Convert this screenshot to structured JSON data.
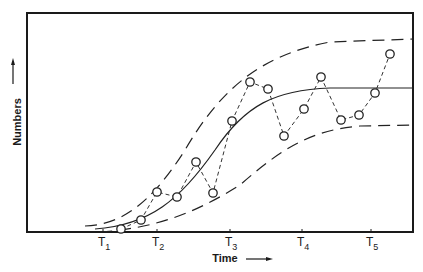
{
  "chart_data": {
    "type": "line",
    "title": "",
    "xlabel": "Time",
    "ylabel": "Numbers",
    "x_ticks": [
      {
        "label": "T",
        "sub": "1",
        "px": 103
      },
      {
        "label": "T",
        "sub": "2",
        "px": 157
      },
      {
        "label": "T",
        "sub": "3",
        "px": 230
      },
      {
        "label": "T",
        "sub": "4",
        "px": 302
      },
      {
        "label": "T",
        "sub": "5",
        "px": 371
      }
    ],
    "grid": false,
    "legend": null,
    "series": [
      {
        "name": "observed",
        "style": "dashed-with-circle-markers",
        "points_px": [
          [
            121,
            229
          ],
          [
            141,
            220
          ],
          [
            157,
            192
          ],
          [
            177,
            197
          ],
          [
            196,
            162
          ],
          [
            213,
            193
          ],
          [
            232,
            121
          ],
          [
            250,
            82
          ],
          [
            268,
            89
          ],
          [
            284,
            136
          ],
          [
            304,
            109
          ],
          [
            321,
            77
          ],
          [
            341,
            120
          ],
          [
            359,
            115
          ],
          [
            375,
            93
          ],
          [
            390,
            54
          ]
        ]
      },
      {
        "name": "mean logistic curve",
        "style": "solid",
        "path": "M 95 229 C 150 225, 180 200, 215 150 C 245 105, 275 90, 330 88 L 413 88"
      },
      {
        "name": "upper bound",
        "style": "long-dash",
        "path": "M 85 226 C 120 225, 150 205, 185 150 C 220 90, 260 55, 330 42 L 413 39"
      },
      {
        "name": "lower bound",
        "style": "long-dash",
        "path": "M 100 232 C 160 228, 200 210, 240 185 C 280 150, 310 130, 360 126 L 413 125"
      }
    ]
  },
  "axes": {
    "x_title": "Time",
    "y_title": "Numbers",
    "x_arrow": "right-arrow",
    "y_arrow": "up-arrow"
  }
}
